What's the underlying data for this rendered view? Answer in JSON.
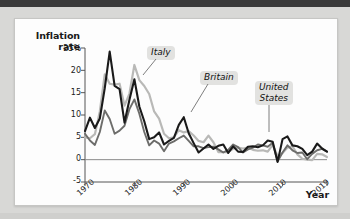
{
  "figure": {
    "background": "#d8d8d6",
    "card_background": "#fdfdfd"
  },
  "chart_data": {
    "type": "line",
    "title": "",
    "xlabel": "Year",
    "ylabel": "Inflation rate",
    "ylabel_line1": "Inflation",
    "ylabel_line2": "rate",
    "xlim": [
      1970,
      2019
    ],
    "ylim": [
      -5,
      25
    ],
    "grid": false,
    "zero_line": true,
    "legend": "inline-annotations",
    "ytick_labels": [
      "25%",
      "20",
      "15",
      "10",
      "5",
      "0",
      "-5"
    ],
    "ytick_values": [
      25,
      20,
      15,
      10,
      5,
      0,
      -5
    ],
    "xtick_labels": [
      "1970",
      "1980",
      "1990",
      "2000",
      "2010",
      "2019"
    ],
    "xtick_values": [
      1970,
      1980,
      1990,
      2000,
      2010,
      2019
    ],
    "x": [
      1970,
      1971,
      1972,
      1973,
      1974,
      1975,
      1976,
      1977,
      1978,
      1979,
      1980,
      1981,
      1982,
      1983,
      1984,
      1985,
      1986,
      1987,
      1988,
      1989,
      1990,
      1991,
      1992,
      1993,
      1994,
      1995,
      1996,
      1997,
      1998,
      1999,
      2000,
      2001,
      2002,
      2003,
      2004,
      2005,
      2006,
      2007,
      2008,
      2009,
      2010,
      2011,
      2012,
      2013,
      2014,
      2015,
      2016,
      2017,
      2018,
      2019
    ],
    "series": [
      {
        "name": "Britain",
        "color": "#1a1a1a",
        "values": [
          6.4,
          9.4,
          7.1,
          9.2,
          16.0,
          24.2,
          16.5,
          15.8,
          8.3,
          13.4,
          18.0,
          11.9,
          8.6,
          4.6,
          5.0,
          6.1,
          3.4,
          4.2,
          4.9,
          7.8,
          9.5,
          5.9,
          3.7,
          1.6,
          2.5,
          3.4,
          2.4,
          3.1,
          3.4,
          1.5,
          3.0,
          1.8,
          1.7,
          2.9,
          3.0,
          2.8,
          3.2,
          4.3,
          4.0,
          -0.5,
          4.6,
          5.2,
          3.2,
          3.0,
          2.4,
          1.0,
          1.8,
          3.6,
          2.5,
          1.8
        ]
      },
      {
        "name": "Italy",
        "color": "#b9b9b7",
        "values": [
          5.0,
          4.8,
          5.7,
          10.8,
          19.1,
          17.0,
          16.8,
          17.0,
          12.1,
          14.8,
          21.2,
          17.8,
          16.5,
          14.7,
          10.8,
          9.2,
          5.8,
          4.8,
          5.0,
          6.6,
          6.1,
          6.4,
          5.4,
          4.2,
          3.9,
          5.4,
          3.9,
          1.7,
          1.7,
          1.7,
          2.5,
          2.7,
          2.5,
          2.7,
          2.2,
          2.0,
          2.1,
          1.8,
          3.3,
          0.8,
          1.5,
          2.7,
          3.0,
          1.2,
          0.2,
          0.0,
          -0.1,
          1.3,
          1.2,
          0.6
        ]
      },
      {
        "name": "United States",
        "color": "#6d6d6b",
        "values": [
          5.8,
          4.3,
          3.3,
          6.2,
          11.0,
          9.1,
          5.8,
          6.5,
          7.6,
          11.3,
          13.5,
          10.3,
          6.2,
          3.2,
          4.3,
          3.6,
          1.9,
          3.6,
          4.1,
          4.8,
          5.4,
          4.2,
          3.0,
          3.0,
          2.6,
          2.8,
          2.9,
          2.3,
          1.6,
          2.2,
          3.4,
          2.8,
          1.6,
          2.3,
          2.7,
          3.4,
          3.2,
          2.9,
          3.8,
          -0.4,
          1.6,
          3.2,
          2.1,
          1.5,
          1.6,
          0.1,
          1.3,
          2.1,
          2.4,
          1.8
        ]
      }
    ],
    "annotations": [
      {
        "name": "Italy",
        "text": "Italy"
      },
      {
        "name": "Britain",
        "text": "Britain"
      },
      {
        "name": "United States",
        "text_line1": "United",
        "text_line2": "States"
      }
    ]
  }
}
